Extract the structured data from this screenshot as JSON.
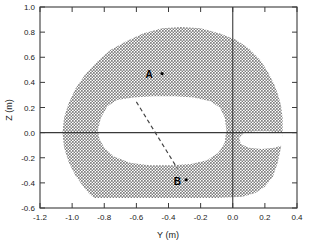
{
  "chart_data": {
    "type": "area",
    "title": "",
    "xlabel": "Y (m)",
    "ylabel": "Z (m)",
    "xlim": [
      -1.2,
      0.4
    ],
    "ylim": [
      -0.6,
      1.0
    ],
    "xticks": [
      -1.2,
      -1.0,
      -0.8,
      -0.6,
      -0.4,
      -0.2,
      0.0,
      0.2,
      0.4
    ],
    "yticks": [
      -0.6,
      -0.4,
      -0.2,
      0.0,
      0.2,
      0.4,
      0.6,
      0.8,
      1.0
    ],
    "xtick_labels": [
      "-1.2",
      "-1.0",
      "-0.8",
      "-0.6",
      "-0.4",
      "-0.2",
      "0.0",
      "0.2",
      "0.4"
    ],
    "ytick_labels": [
      "-0.6",
      "-0.4",
      "-0.2",
      "0.0",
      "0.2",
      "0.4",
      "0.6",
      "0.8",
      "1.0"
    ],
    "grid": false,
    "legend": "none",
    "reference_lines": [
      {
        "name": "y-zero-horizontal",
        "orientation": "horizontal",
        "value": 0.0
      },
      {
        "name": "x-zero-vertical",
        "orientation": "vertical",
        "value": 0.0
      }
    ],
    "shaded_region": {
      "name": "stippled-region",
      "description": "dotted/stippled annulus-shaped region",
      "fill_pattern": "stipple-dots",
      "outer_boundary": [
        [
          -0.86,
          -0.52
        ],
        [
          -0.7,
          -0.52
        ],
        [
          -0.5,
          -0.52
        ],
        [
          -0.3,
          -0.52
        ],
        [
          -0.1,
          -0.52
        ],
        [
          0.06,
          -0.51
        ],
        [
          0.14,
          -0.48
        ],
        [
          0.2,
          -0.43
        ],
        [
          0.25,
          -0.35
        ],
        [
          0.28,
          -0.24
        ],
        [
          0.3,
          -0.12
        ],
        [
          0.31,
          0.0
        ],
        [
          0.31,
          0.12
        ],
        [
          0.3,
          0.22
        ],
        [
          0.28,
          0.31
        ],
        [
          0.26,
          0.38
        ],
        [
          0.22,
          0.48
        ],
        [
          0.17,
          0.58
        ],
        [
          0.1,
          0.67
        ],
        [
          0.02,
          0.74
        ],
        [
          -0.08,
          0.79
        ],
        [
          -0.2,
          0.83
        ],
        [
          -0.32,
          0.84
        ],
        [
          -0.44,
          0.83
        ],
        [
          -0.56,
          0.79
        ],
        [
          -0.66,
          0.73
        ],
        [
          -0.76,
          0.66
        ],
        [
          -0.84,
          0.57
        ],
        [
          -0.92,
          0.46
        ],
        [
          -0.98,
          0.35
        ],
        [
          -1.02,
          0.24
        ],
        [
          -1.05,
          0.12
        ],
        [
          -1.06,
          0.0
        ],
        [
          -1.05,
          -0.12
        ],
        [
          -1.02,
          -0.24
        ],
        [
          -0.98,
          -0.34
        ],
        [
          -0.93,
          -0.43
        ],
        [
          -0.89,
          -0.49
        ]
      ],
      "inner_cavity": [
        [
          -0.84,
          0.02
        ],
        [
          -0.82,
          0.12
        ],
        [
          -0.78,
          0.21
        ],
        [
          -0.72,
          0.26
        ],
        [
          -0.62,
          0.28
        ],
        [
          -0.5,
          0.29
        ],
        [
          -0.36,
          0.29
        ],
        [
          -0.24,
          0.28
        ],
        [
          -0.14,
          0.25
        ],
        [
          -0.08,
          0.2
        ],
        [
          -0.05,
          0.12
        ],
        [
          -0.04,
          0.02
        ],
        [
          -0.05,
          -0.08
        ],
        [
          -0.09,
          -0.16
        ],
        [
          -0.16,
          -0.22
        ],
        [
          -0.26,
          -0.25
        ],
        [
          -0.38,
          -0.26
        ],
        [
          -0.52,
          -0.26
        ],
        [
          -0.64,
          -0.24
        ],
        [
          -0.74,
          -0.19
        ],
        [
          -0.8,
          -0.12
        ],
        [
          -0.83,
          -0.05
        ]
      ],
      "right_notch": [
        [
          0.31,
          0.0
        ],
        [
          0.22,
          0.01
        ],
        [
          0.14,
          0.01
        ],
        [
          0.07,
          0.0
        ],
        [
          0.04,
          -0.04
        ],
        [
          0.05,
          -0.09
        ],
        [
          0.1,
          -0.12
        ],
        [
          0.18,
          -0.13
        ],
        [
          0.26,
          -0.12
        ],
        [
          0.31,
          -0.1
        ]
      ]
    },
    "markers": [
      {
        "name": "point-A",
        "label": "A",
        "x": -0.52,
        "y": 0.47,
        "marker_x": -0.44,
        "marker_y": 0.47
      },
      {
        "name": "point-B",
        "label": "B",
        "x": -0.345,
        "y": -0.385,
        "marker_x": -0.29,
        "marker_y": -0.375
      }
    ],
    "dashed_connector": {
      "name": "A-to-B-dashed-line",
      "style": "dashed",
      "from": [
        -0.6,
        0.245
      ],
      "to": [
        -0.345,
        -0.285
      ]
    }
  }
}
